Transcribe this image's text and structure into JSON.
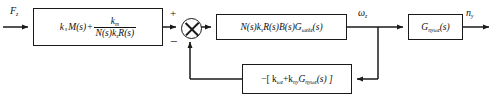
{
  "diagram": {
    "kind": "control-system-block-diagram",
    "colors": {
      "line": "#1a1a1a",
      "background": "#ffffff",
      "text": "#111111"
    },
    "signals": {
      "input_label": "F",
      "input_sub": "z",
      "mid_label": "ω",
      "mid_sub": "z",
      "output_label": "n",
      "output_sub": "y"
    },
    "summing_junction": {
      "name": "summing-junction",
      "plus_sign": "+",
      "minus_sign": "−",
      "plus_input": "from-feedforward-block",
      "minus_input": "from-feedback-block"
    },
    "blocks": {
      "feedforward": {
        "name": "feedforward-block",
        "term1_k": "k",
        "term1_k_sub": "s",
        "term1_rest": "M(s)",
        "operator": "+",
        "numerator_k": "k",
        "numerator_k_sub": "m",
        "denominator": "N(s)k",
        "denominator_sub": "s",
        "denominator_tail": "R(s)",
        "text_plain": "k_s M(s) + k_m / ( N(s) k_s R(s) )"
      },
      "plant": {
        "name": "plant-block",
        "prefix": "N(s)k",
        "prefix_sub": "s",
        "mid": "R(s)B(s)G",
        "g_sub": "ωzδz",
        "suffix": "(s)",
        "text_plain": "N(s)k_s R(s) B(s) G_wz dz (s)"
      },
      "output": {
        "name": "output-transfer-block",
        "g": "G",
        "g_sub": "nyωz",
        "suffix": "(s)",
        "text_plain": "G_ny wz (s)"
      },
      "feedback": {
        "name": "feedback-block",
        "lead": "−[ k",
        "k1_sub": "ωz",
        "operator": "+k",
        "k2_sub": "ny",
        "g": "G",
        "g_sub": "nyωz",
        "tail": "(s) ]",
        "text_plain": "-[ k_wz + k_ny G_ny wz (s) ]"
      }
    }
  }
}
